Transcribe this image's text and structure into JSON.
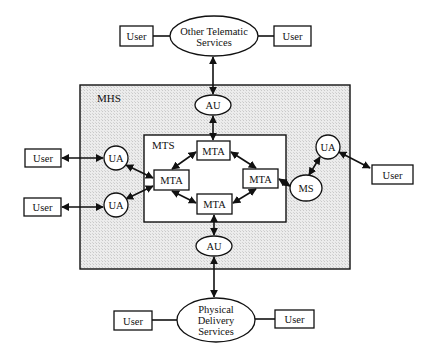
{
  "diagram": {
    "title": "",
    "colors": {
      "stroke": "#111111",
      "fill": "#ffffff",
      "shade": "#e4e4e4"
    },
    "containers": {
      "mhs": {
        "label": "MHS",
        "x": 80,
        "y": 85,
        "w": 270,
        "h": 184
      },
      "mts": {
        "label": "MTS",
        "x": 144,
        "y": 135,
        "w": 142,
        "h": 87
      }
    },
    "ellipses": {
      "other_telematic": {
        "lines": [
          "Other Telematic",
          "Services"
        ],
        "cx": 214,
        "cy": 36,
        "rx": 44,
        "ry": 20
      },
      "physical_delivery": {
        "lines": [
          "Physical",
          "Delivery",
          "Services"
        ],
        "cx": 216,
        "cy": 320,
        "rx": 39,
        "ry": 22
      },
      "au_top": {
        "label": "AU",
        "cx": 213,
        "cy": 105,
        "rx": 18,
        "ry": 10
      },
      "au_bottom": {
        "label": "AU",
        "cx": 214,
        "cy": 246,
        "rx": 18,
        "ry": 10
      },
      "ms": {
        "label": "MS",
        "cx": 306,
        "cy": 188,
        "rx": 16,
        "ry": 13
      }
    },
    "circles": {
      "ua_left_top": {
        "label": "UA",
        "cx": 116,
        "cy": 158,
        "r": 12
      },
      "ua_left_bottom": {
        "label": "UA",
        "cx": 116,
        "cy": 205,
        "r": 12
      },
      "ua_right": {
        "label": "UA",
        "cx": 328,
        "cy": 147,
        "r": 12
      }
    },
    "boxes": {
      "mta_top": {
        "label": "MTA",
        "x": 197,
        "y": 141,
        "w": 33,
        "h": 19
      },
      "mta_left": {
        "label": "MTA",
        "x": 154,
        "y": 170,
        "w": 35,
        "h": 20
      },
      "mta_right": {
        "label": "MTA",
        "x": 243,
        "y": 169,
        "w": 35,
        "h": 19
      },
      "mta_bottom": {
        "label": "MTA",
        "x": 197,
        "y": 194,
        "w": 35,
        "h": 20
      },
      "user_top_left": {
        "label": "User",
        "x": 120,
        "y": 26,
        "w": 33,
        "h": 20
      },
      "user_top_right": {
        "label": "User",
        "x": 274,
        "y": 26,
        "w": 37,
        "h": 20
      },
      "user_left_top": {
        "label": "User",
        "x": 25,
        "y": 149,
        "w": 36,
        "h": 18
      },
      "user_left_bottom": {
        "label": "User",
        "x": 24,
        "y": 198,
        "w": 37,
        "h": 18
      },
      "user_right": {
        "label": "User",
        "x": 372,
        "y": 165,
        "w": 41,
        "h": 19
      },
      "user_bottom_left": {
        "label": "User",
        "x": 114,
        "y": 311,
        "w": 38,
        "h": 19
      },
      "user_bottom_right": {
        "label": "User",
        "x": 275,
        "y": 310,
        "w": 39,
        "h": 18
      }
    },
    "connections": [
      {
        "from": "user_top_left",
        "to": "other_telematic",
        "x1": 153,
        "y1": 36,
        "x2": 170,
        "y2": 36,
        "arrows": "none"
      },
      {
        "from": "other_telematic",
        "to": "user_top_right",
        "x1": 258,
        "y1": 36,
        "x2": 274,
        "y2": 36,
        "arrows": "none"
      },
      {
        "from": "other_telematic",
        "to": "au_top",
        "x1": 213,
        "y1": 57,
        "x2": 213,
        "y2": 94,
        "arrows": "both"
      },
      {
        "from": "au_top",
        "to": "mta_top",
        "x1": 213,
        "y1": 116,
        "x2": 213,
        "y2": 140,
        "arrows": "both"
      },
      {
        "from": "user_left_top",
        "to": "ua_left_top",
        "x1": 62,
        "y1": 158,
        "x2": 103,
        "y2": 158,
        "arrows": "both"
      },
      {
        "from": "user_left_bottom",
        "to": "ua_left_bottom",
        "x1": 62,
        "y1": 207,
        "x2": 103,
        "y2": 207,
        "arrows": "both"
      },
      {
        "from": "ua_left_top",
        "to": "mta_left",
        "x1": 126,
        "y1": 165,
        "x2": 153,
        "y2": 178,
        "arrows": "both"
      },
      {
        "from": "ua_left_bottom",
        "to": "mta_left",
        "x1": 126,
        "y1": 199,
        "x2": 153,
        "y2": 186,
        "arrows": "both"
      },
      {
        "from": "mta_left",
        "to": "mta_top",
        "x1": 172,
        "y1": 169,
        "x2": 196,
        "y2": 152,
        "arrows": "both"
      },
      {
        "from": "mta_top",
        "to": "mta_right",
        "x1": 231,
        "y1": 152,
        "x2": 256,
        "y2": 168,
        "arrows": "both"
      },
      {
        "from": "mta_left",
        "to": "mta_bottom",
        "x1": 172,
        "y1": 191,
        "x2": 196,
        "y2": 203,
        "arrows": "both"
      },
      {
        "from": "mta_bottom",
        "to": "mta_right",
        "x1": 233,
        "y1": 203,
        "x2": 256,
        "y2": 189,
        "arrows": "both"
      },
      {
        "from": "mta_right",
        "to": "ms",
        "x1": 279,
        "y1": 179,
        "x2": 290,
        "y2": 186,
        "arrows": "both"
      },
      {
        "from": "ms",
        "to": "ua_right",
        "x1": 309,
        "y1": 175,
        "x2": 320,
        "y2": 157,
        "arrows": "both"
      },
      {
        "from": "ua_right",
        "to": "user_right",
        "x1": 339,
        "y1": 152,
        "x2": 370,
        "y2": 168,
        "arrows": "both"
      },
      {
        "from": "mta_bottom",
        "to": "au_bottom",
        "x1": 214,
        "y1": 215,
        "x2": 214,
        "y2": 235,
        "arrows": "both"
      },
      {
        "from": "au_bottom",
        "to": "physical_delivery",
        "x1": 214,
        "y1": 257,
        "x2": 214,
        "y2": 297,
        "arrows": "both"
      },
      {
        "from": "user_bottom_left",
        "to": "physical_delivery",
        "x1": 152,
        "y1": 320,
        "x2": 177,
        "y2": 320,
        "arrows": "none"
      },
      {
        "from": "physical_delivery",
        "to": "user_bottom_right",
        "x1": 255,
        "y1": 319,
        "x2": 275,
        "y2": 319,
        "arrows": "none"
      }
    ]
  }
}
